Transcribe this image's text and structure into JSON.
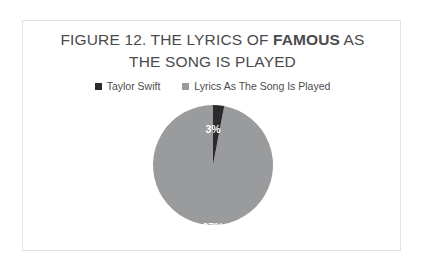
{
  "figure": {
    "title_line_1_prefix": "FIGURE 12. THE LYRICS OF ",
    "title_emphasis": "FAMOUS",
    "title_line_1_suffix": " AS",
    "title_line_2": "THE SONG IS PLAYED",
    "border_color": "#e2e2e4",
    "background": "#ffffff"
  },
  "chart_data": {
    "type": "pie",
    "title": "FIGURE 12. THE LYRICS OF FAMOUS AS THE SONG IS PLAYED",
    "xlabel": "",
    "ylabel": "",
    "legend_position": "top",
    "grid": false,
    "categories": [
      "Taylor Swift",
      "Lyrics As The Song Is Played"
    ],
    "values": [
      3,
      97
    ],
    "value_labels": [
      "3%",
      "97%"
    ],
    "units": "percent",
    "colors": [
      "#2b2b2d",
      "#9a9b9d"
    ],
    "start_angle_deg": 0,
    "direction": "clockwise",
    "series": [
      {
        "name": "Share of lyrics",
        "values": [
          3,
          97
        ]
      }
    ],
    "legend": [
      {
        "label": "Taylor Swift",
        "color": "#2b2b2d",
        "value": 3,
        "value_label": "3%"
      },
      {
        "label": "Lyrics As The Song Is Played",
        "color": "#9a9b9d",
        "value": 97,
        "value_label": "97%"
      }
    ],
    "slice_label_color": "#ffffff"
  }
}
